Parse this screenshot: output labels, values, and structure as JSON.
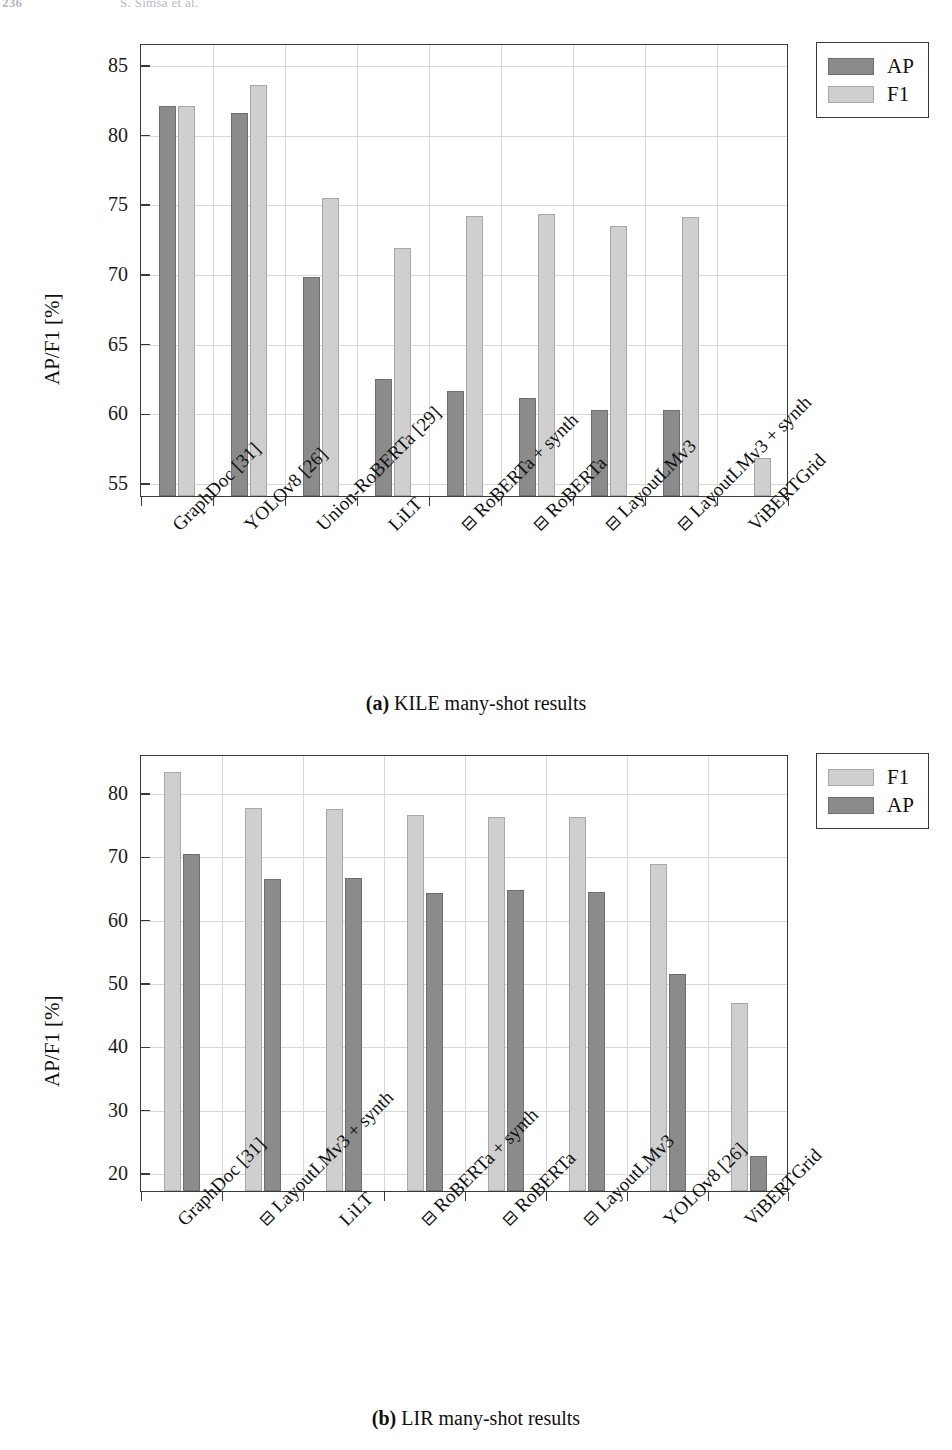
{
  "header": {
    "folio": "236",
    "authors": "Š. Šimsa et al."
  },
  "figures": [
    {
      "id": "a",
      "caption_tag": "(a)",
      "caption_text": "KILE many-shot results",
      "ylabel": "AP/F1 [%]",
      "legend": [
        {
          "key": "ap",
          "label": "AP"
        },
        {
          "key": "f1",
          "label": "F1"
        }
      ],
      "chart_data": {
        "type": "bar",
        "title": "KILE many-shot results",
        "xlabel": "",
        "ylabel": "AP/F1 [%]",
        "ylim": [
          54.0,
          86.5
        ],
        "yticks": [
          55,
          60,
          65,
          70,
          75,
          80,
          85
        ],
        "grid": true,
        "legend_position": "outside-top-right",
        "categories": [
          "GraphDoc [31]",
          "YOLOv8 [26]",
          "Union-RoBERTa [29]",
          "LiLT",
          "⊟ RoBERTa + synth",
          "⊟ RoBERTa",
          "⊟ LayoutLMv3",
          "⊟ LayoutLMv3 + synth",
          "ViBERTGrid"
        ],
        "series": [
          {
            "name": "AP",
            "color": "#8b8b8b",
            "values": [
              82.0,
              81.5,
              69.7,
              62.4,
              61.5,
              61.0,
              60.2,
              60.2,
              null
            ]
          },
          {
            "name": "F1",
            "color": "#cfcfcf",
            "values": [
              82.0,
              83.5,
              75.4,
              71.8,
              74.1,
              74.2,
              73.4,
              74.0,
              56.7
            ]
          }
        ]
      }
    },
    {
      "id": "b",
      "caption_tag": "(b)",
      "caption_text": "LIR many-shot results",
      "ylabel": "AP/F1 [%]",
      "legend": [
        {
          "key": "f1",
          "label": "F1"
        },
        {
          "key": "ap",
          "label": "AP"
        }
      ],
      "chart_data": {
        "type": "bar",
        "title": "LIR many-shot results",
        "xlabel": "",
        "ylabel": "AP/F1 [%]",
        "ylim": [
          17.0,
          86.0
        ],
        "yticks": [
          20,
          30,
          40,
          50,
          60,
          70,
          80
        ],
        "grid": true,
        "legend_position": "outside-top-right",
        "categories": [
          "GraphDoc [31]",
          "⊟ LayoutLMv3 + synth",
          "LiLT",
          "⊟ RoBERTa + synth",
          "⊟ RoBERTa",
          "⊟ LayoutLMv3",
          "YOLOv8 [26]",
          "ViBERTGrid"
        ],
        "series": [
          {
            "name": "F1",
            "color": "#cfcfcf",
            "values": [
              83.2,
              77.4,
              77.3,
              76.3,
              76.0,
              76.0,
              68.6,
              46.7
            ]
          },
          {
            "name": "AP",
            "color": "#8b8b8b",
            "values": [
              70.2,
              66.2,
              66.4,
              64.0,
              64.5,
              64.2,
              51.3,
              22.5
            ]
          }
        ]
      }
    }
  ]
}
